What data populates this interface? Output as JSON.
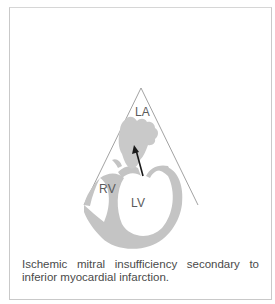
{
  "figure": {
    "labels": {
      "la": "LA",
      "rv": "RV",
      "lv": "LV"
    },
    "colors": {
      "wall": "#c4c4c4",
      "jet": "#c9c9c9",
      "sector_line": "#888888",
      "arrow": "#1a1a1a",
      "frame_border": "#c9c9c9"
    },
    "view": "apical echocardiographic sector",
    "arrow_direction": "LV to LA (regurgitant jet)"
  },
  "caption": {
    "line1": "Ischemic mitral insufficiency secondary to",
    "line2": "inferior myocardial infarction."
  }
}
